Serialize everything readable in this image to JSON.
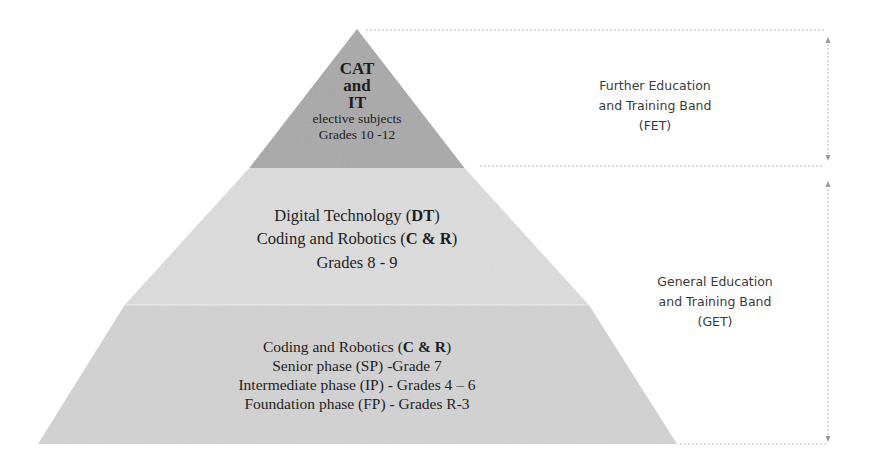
{
  "diagram": {
    "type": "pyramid",
    "colors": {
      "top_band": "#a9a9a9",
      "middle_band": "#dcdcdc",
      "bottom_band": "#d2d2d2",
      "guide_lines": "#b8b8b8",
      "text": "#1e1e1e",
      "band_label_text": "#3a3a3a"
    },
    "tiers": [
      {
        "id": "top",
        "lines": [
          {
            "text": "CAT",
            "bold": true
          },
          {
            "text": "and",
            "bold": true
          },
          {
            "text": "IT",
            "bold": true
          },
          {
            "text": "elective subjects",
            "bold": false
          },
          {
            "text": "Grades 10 -12",
            "bold": false
          }
        ]
      },
      {
        "id": "middle",
        "lines": [
          {
            "prefix": "Digital Technology (",
            "bold_part": "DT",
            "suffix": ")"
          },
          {
            "prefix": "Coding and Robotics (",
            "bold_part": "C & R",
            "suffix": ")"
          },
          {
            "text": "Grades 8 - 9"
          }
        ]
      },
      {
        "id": "bottom",
        "lines": [
          {
            "prefix": "Coding and Robotics (",
            "bold_part": "C & R",
            "suffix": ")"
          },
          {
            "text": "Senior phase (SP) -Grade 7"
          },
          {
            "text": "Intermediate phase (IP) - Grades 4 – 6"
          },
          {
            "text": "Foundation phase (FP) - Grades R-3"
          }
        ]
      }
    ],
    "bands": [
      {
        "id": "fet",
        "lines": [
          "Further Education",
          "and Training Band",
          "(FET)"
        ]
      },
      {
        "id": "get",
        "lines": [
          "General Education",
          "and Training Band",
          "(GET)"
        ]
      }
    ]
  }
}
